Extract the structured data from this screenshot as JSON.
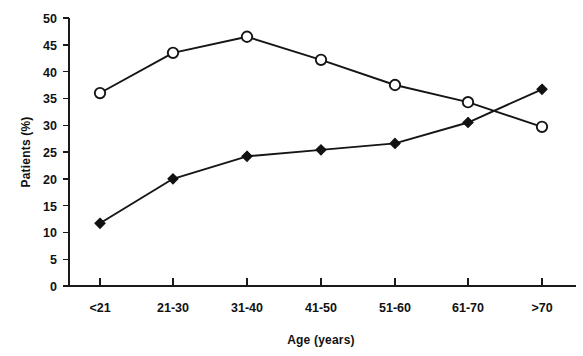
{
  "chart_data": {
    "type": "line",
    "title": "",
    "xlabel": "Age (years)",
    "ylabel": "Patients (%)",
    "categories": [
      "<21",
      "21-30",
      "31-40",
      "41-50",
      "51-60",
      "61-70",
      ">70"
    ],
    "ylim": [
      0,
      50
    ],
    "yticks": [
      0,
      5,
      10,
      15,
      20,
      25,
      30,
      35,
      40,
      45,
      50
    ],
    "grid": false,
    "legend": "none",
    "series": [
      {
        "name": "open-circle-series",
        "marker": "open-circle",
        "values": [
          36.0,
          43.5,
          46.5,
          42.2,
          37.5,
          34.3,
          29.7
        ]
      },
      {
        "name": "filled-diamond-series",
        "marker": "filled-diamond",
        "values": [
          11.7,
          20.0,
          24.2,
          25.4,
          26.6,
          30.5,
          36.7
        ]
      }
    ]
  },
  "axis": {
    "y_label": "Patients (%)",
    "x_label": "Age (years)",
    "y_tick_labels": [
      "50",
      "45",
      "40",
      "35",
      "30",
      "25",
      "20",
      "15",
      "10",
      "5",
      "0"
    ],
    "x_tick_labels": [
      "<21",
      "21-30",
      "31-40",
      "41-50",
      "51-60",
      "61-70",
      ">70"
    ]
  },
  "colors": {
    "ink": "#151515",
    "background": "#ffffff",
    "marker_fill_open": "#ffffff",
    "marker_fill_solid": "#111111"
  }
}
